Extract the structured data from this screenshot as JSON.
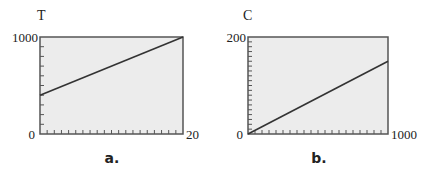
{
  "chart_data": [
    {
      "type": "line",
      "panel_label": "a.",
      "title": "",
      "xlabel": "",
      "ylabel": "T",
      "xlim": [
        0,
        20
      ],
      "ylim": [
        0,
        1000
      ],
      "x_tick_labels": [
        "20"
      ],
      "y_tick_labels": [
        "0",
        "1000"
      ],
      "x_tick_count": 20,
      "y_tick_count": 10,
      "grid": false,
      "series": [
        {
          "name": "T",
          "x": [
            0,
            20
          ],
          "y": [
            400,
            1000
          ]
        }
      ]
    },
    {
      "type": "line",
      "panel_label": "b.",
      "title": "",
      "xlabel": "",
      "ylabel": "C",
      "xlim": [
        0,
        1000
      ],
      "ylim": [
        0,
        200
      ],
      "x_tick_labels": [
        "1000"
      ],
      "y_tick_labels": [
        "0",
        "200"
      ],
      "x_tick_count": 20,
      "y_tick_count": 20,
      "grid": false,
      "series": [
        {
          "name": "C",
          "x": [
            0,
            1000
          ],
          "y": [
            0,
            150
          ]
        }
      ]
    }
  ],
  "panels": {
    "a": {
      "ylabel": "T",
      "ymax_label": "1000",
      "ymin_label": "0",
      "xmax_label": "20",
      "caption": "a."
    },
    "b": {
      "ylabel": "C",
      "ymax_label": "200",
      "ymin_label": "0",
      "xmax_label": "1000",
      "caption": "b."
    }
  },
  "colors": {
    "plot_bg": "#ececec",
    "frame": "#555555",
    "line": "#333333",
    "text": "#222222"
  }
}
